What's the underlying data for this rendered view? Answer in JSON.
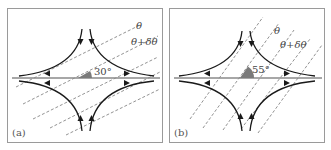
{
  "panels": [
    {
      "id": "a",
      "label": "(a)",
      "angle_label": "30°",
      "angle_deg": 30,
      "line1_label": "θ",
      "line2_label": "θ+δθ"
    },
    {
      "id": "b",
      "label": "(b)",
      "angle_label": "55°",
      "angle_deg": 55,
      "line1_label": "θ",
      "line2_label": "θ+δθ"
    }
  ],
  "colors": {
    "frame": "#9a9a9a",
    "axis": "#8a8a8a",
    "curve": "#1a1a1a",
    "dashed": "#777777",
    "angle_fill": "#7a7a7a"
  }
}
